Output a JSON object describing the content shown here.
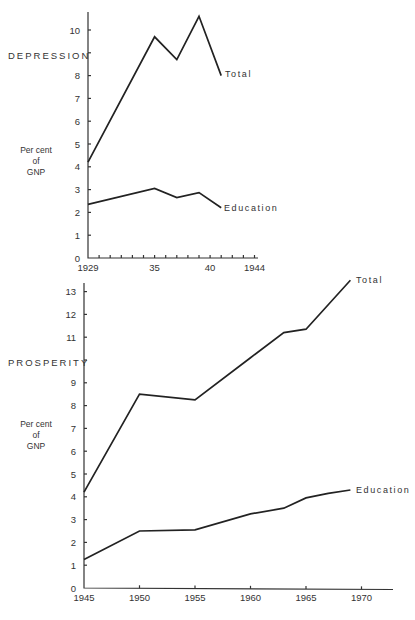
{
  "chart_data": [
    {
      "type": "line",
      "title": "DEPRESSION",
      "xlabel": "",
      "ylabel": "Per cent of GNP",
      "x_tick_labels": [
        "1929",
        "35",
        "40",
        "1944"
      ],
      "x_tick_values": [
        1929,
        1935,
        1940,
        1944
      ],
      "y_tick_labels": [
        "0",
        "1",
        "2",
        "3",
        "4",
        "5",
        "6",
        "7",
        "8",
        "10"
      ],
      "xlim": [
        1929,
        1944
      ],
      "ylim": [
        0,
        10.8
      ],
      "grid": false,
      "legend": "inline labels at line ends",
      "series": [
        {
          "name": "Total",
          "x": [
            1929,
            1935,
            1937,
            1939,
            1941
          ],
          "values": [
            4.2,
            9.7,
            8.7,
            10.6,
            8.0
          ]
        },
        {
          "name": "Education",
          "x": [
            1929,
            1935,
            1937,
            1939,
            1941
          ],
          "values": [
            2.35,
            3.05,
            2.65,
            2.87,
            2.2
          ]
        }
      ]
    },
    {
      "type": "line",
      "title": "PROSPERITY",
      "xlabel": "",
      "ylabel": "Per cent of GNP",
      "x_tick_labels": [
        "1945",
        "1950",
        "1955",
        "1960",
        "1965",
        "1970"
      ],
      "x_tick_values": [
        1945,
        1950,
        1955,
        1960,
        1965,
        1970
      ],
      "y_tick_labels": [
        "0",
        "1",
        "2",
        "3",
        "4",
        "5",
        "6",
        "7",
        "8",
        "9",
        "11",
        "12",
        "13"
      ],
      "xlim": [
        1945,
        1972
      ],
      "ylim": [
        0,
        13.3
      ],
      "grid": false,
      "legend": "inline labels at line ends",
      "series": [
        {
          "name": "Total",
          "x": [
            1945,
            1950,
            1955,
            1960,
            1963,
            1965,
            1969
          ],
          "values": [
            4.2,
            8.5,
            8.25,
            10.1,
            11.2,
            11.35,
            13.5
          ]
        },
        {
          "name": "Education",
          "x": [
            1945,
            1950,
            1955,
            1960,
            1963,
            1965,
            1967,
            1969
          ],
          "values": [
            1.25,
            2.5,
            2.55,
            3.25,
            3.5,
            3.95,
            4.15,
            4.3
          ]
        }
      ]
    }
  ],
  "labels": {
    "depression_title": "DEPRESSION",
    "prosperity_title": "PROSPERITY",
    "ylabel_line1": "Per cent",
    "ylabel_line2": "of",
    "ylabel_line3": "GNP",
    "total": "Total",
    "education": "Education"
  }
}
